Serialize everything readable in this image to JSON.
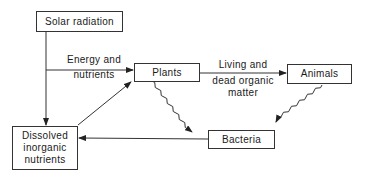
{
  "diagram": {
    "nodes": {
      "solar": {
        "label": "Solar radiation"
      },
      "plants": {
        "label": "Plants"
      },
      "animals": {
        "label": "Animals"
      },
      "bacteria": {
        "label": "Bacteria"
      },
      "dissolved": {
        "line1": "Dissolved",
        "line2": "inorganic",
        "line3": "nutrients"
      }
    },
    "edge_labels": {
      "energy": {
        "line1": "Energy and",
        "line2": "nutrients"
      },
      "organic": {
        "line1": "Living and",
        "line2": "dead organic",
        "line3": "matter"
      }
    },
    "edges": [
      {
        "from": "Solar radiation",
        "to": "Plants",
        "style": "solid",
        "label": "Energy and nutrients"
      },
      {
        "from": "Solar radiation",
        "to": "Dissolved inorganic nutrients",
        "style": "solid"
      },
      {
        "from": "Dissolved inorganic nutrients",
        "to": "Plants",
        "style": "solid"
      },
      {
        "from": "Plants",
        "to": "Animals",
        "style": "solid",
        "label": "Living and dead organic matter"
      },
      {
        "from": "Plants",
        "to": "Bacteria",
        "style": "wavy"
      },
      {
        "from": "Animals",
        "to": "Bacteria",
        "style": "wavy"
      },
      {
        "from": "Bacteria",
        "to": "Dissolved inorganic nutrients",
        "style": "solid"
      }
    ]
  }
}
